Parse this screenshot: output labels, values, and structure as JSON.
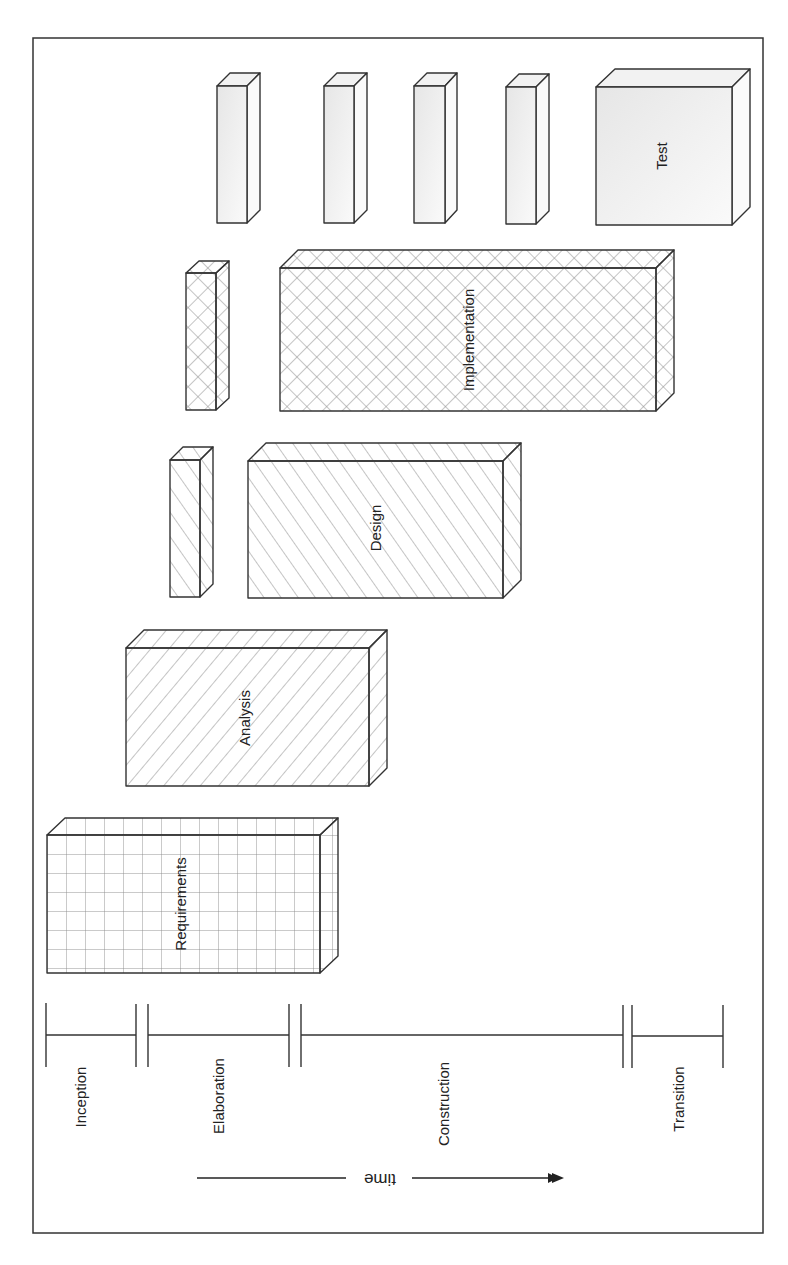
{
  "diagram": {
    "orientation": "rotated 90 degrees clockwise",
    "colors": {
      "stroke": "#333333",
      "hatch": "#8a8a8a",
      "test_fill": "#efefef",
      "background": "#ffffff"
    },
    "workflows": [
      {
        "id": "requirements",
        "label": "Requirements",
        "pattern": "grid"
      },
      {
        "id": "analysis",
        "label": "Analysis",
        "pattern": "backslash-hatch"
      },
      {
        "id": "design",
        "label": "Design",
        "pattern": "slash-hatch"
      },
      {
        "id": "implementation",
        "label": "Implementation",
        "pattern": "crosshatch"
      },
      {
        "id": "test",
        "label": "Test",
        "pattern": "solid-gray"
      }
    ],
    "phases": [
      {
        "id": "inception",
        "label": "Inception"
      },
      {
        "id": "elaboration",
        "label": "Elaboration"
      },
      {
        "id": "construction",
        "label": "Construction"
      },
      {
        "id": "transition",
        "label": "Transition"
      }
    ],
    "time_axis": {
      "label": "time"
    }
  }
}
